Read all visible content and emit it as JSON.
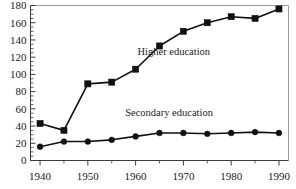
{
  "chart_data": {
    "type": "line",
    "title": "",
    "subtitle": "",
    "xlabel": "",
    "ylabel": "",
    "x": [
      1940,
      1945,
      1950,
      1955,
      1960,
      1965,
      1970,
      1975,
      1980,
      1985,
      1990
    ],
    "xlim": [
      1938,
      1992
    ],
    "ylim": [
      0,
      180
    ],
    "xticks": [
      1940,
      1950,
      1960,
      1970,
      1980,
      1990
    ],
    "xtick_labels": [
      "1940",
      "1950",
      "1960",
      "1970",
      "1980",
      "1990"
    ],
    "xminor_step": 5,
    "yticks": [
      0,
      20,
      40,
      60,
      80,
      100,
      120,
      140,
      160,
      180
    ],
    "ytick_labels": [
      "0",
      "20",
      "40",
      "60",
      "80",
      "100",
      "120",
      "140",
      "160",
      "180"
    ],
    "yminor_step": 5,
    "grid": false,
    "legend_position": "inline-annotation",
    "series": [
      {
        "name": "Higher education",
        "marker": "square",
        "label_x": 1968,
        "label_y": 122,
        "values": [
          43,
          35,
          89,
          91,
          106,
          133,
          150,
          160,
          167,
          165,
          176
        ]
      },
      {
        "name": "Secondary education",
        "marker": "circle",
        "label_x": 1967,
        "label_y": 52,
        "values": [
          16,
          22,
          22,
          24,
          28,
          32,
          32,
          31,
          32,
          33,
          32
        ]
      }
    ],
    "colors": {
      "line": "#111111",
      "marker": "#111111",
      "axis": "#3c3c3c",
      "frame": "#9a9a9a",
      "text": "#1a1a1a",
      "background": "#ffffff"
    }
  }
}
